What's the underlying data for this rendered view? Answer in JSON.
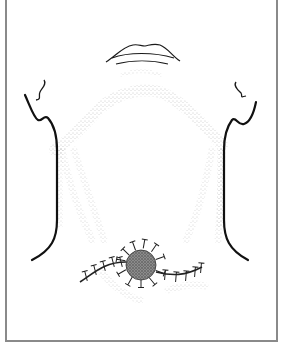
{
  "figure": {
    "width": 281,
    "height": 348,
    "background": "#ffffff",
    "line_color": "#1a1a1a",
    "frame_color": "#8a8a8a",
    "stipple_color": "#9a9a9a",
    "mass_fill": "#6e6e6e",
    "labels": []
  },
  "anatomy": {
    "lips": {
      "upper": "M106,62 C116,56 122,47 133,45 C138,44 141,46 145,46 C150,45 154,43 160,45 C168,48 172,56 180,61",
      "middle": "M112,58 C128,52 154,52 174,58",
      "lower": "M116,64 C132,60 152,60 168,64",
      "chin_stipple": "M122,75 C132,70 150,70 160,75"
    },
    "left_ear": "M44,80 C47,84 42,88 40,92 C38,96 42,99 36,100",
    "right_ear": "M236,82 C233,86 238,90 241,93 C243,96 239,98 246,96",
    "left_neck": "M25,95 C30,106 34,118 38,120 C42,122 44,114 48,118 C55,126 57,140 57,150 L57,220 C57,238 52,250 32,260",
    "right_neck": "M256,102 C254,112 250,122 244,124 C238,126 236,116 232,120 C226,128 224,140 224,150 L224,220 C224,238 229,250 248,260",
    "mandible_arc": "M55,150 C70,140 85,124 100,108 C120,92 140,88 160,92 C180,100 200,120 222,145",
    "stipple_bands": [
      "M62,150 C68,180 78,210 92,240",
      "M74,150 C84,180 94,210 104,240",
      "M212,150 C206,180 200,210 186,240",
      "M222,150 C222,180 220,210 218,240",
      "M100,270 C110,285 130,298 140,300",
      "M168,290 C180,286 195,284 205,286"
    ],
    "mass": {
      "cx": 141,
      "cy": 265,
      "r": 15
    },
    "suture_line": "M80,282 C95,272 105,262 126,262 M156,272 C172,276 185,276 202,267",
    "left_stitches": [
      [
        86,
        276
      ],
      [
        95,
        270
      ],
      [
        104,
        266
      ],
      [
        113,
        262
      ],
      [
        121,
        262
      ]
    ],
    "right_stitches": [
      [
        165,
        275
      ],
      [
        176,
        277
      ],
      [
        186,
        276
      ],
      [
        195,
        272
      ],
      [
        201,
        268
      ]
    ],
    "mass_stitches": [
      [
        126,
        252,
        -45
      ],
      [
        134,
        246,
        -20
      ],
      [
        144,
        244,
        10
      ],
      [
        154,
        248,
        35
      ],
      [
        160,
        258,
        70
      ],
      [
        160,
        272,
        110
      ],
      [
        152,
        281,
        140
      ],
      [
        141,
        283,
        180
      ],
      [
        130,
        281,
        210
      ],
      [
        122,
        272,
        240
      ],
      [
        121,
        260,
        280
      ]
    ]
  }
}
